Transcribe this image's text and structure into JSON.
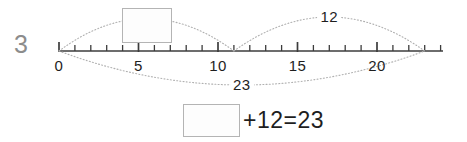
{
  "problem": {
    "number": "3",
    "type": "number-line-addition"
  },
  "number_line": {
    "min": 0,
    "max": 24,
    "tick_interval": 1,
    "labeled_ticks": [
      {
        "value": 0,
        "label": "0"
      },
      {
        "value": 5,
        "label": "5"
      },
      {
        "value": 10,
        "label": "10"
      },
      {
        "value": 15,
        "label": "15"
      },
      {
        "value": 20,
        "label": "20"
      }
    ],
    "axis_color": "#3c3c3c",
    "px_origin": 59,
    "px_per_unit": 15.9,
    "baseline_y": 51
  },
  "jumps": [
    {
      "id": "jump-unknown",
      "from": 0,
      "to": 11,
      "side": "above",
      "label": "",
      "has_answer_box": true,
      "style": "dotted"
    },
    {
      "id": "jump-twelve",
      "from": 11,
      "to": 23,
      "side": "above",
      "label": "12",
      "has_answer_box": false,
      "style": "dotted"
    },
    {
      "id": "jump-total",
      "from": 0,
      "to": 23,
      "side": "below",
      "label": "23",
      "has_answer_box": false,
      "style": "dotted"
    }
  ],
  "equation": {
    "blank_label": "",
    "expression": "+12=23",
    "addend_known": "12",
    "sum": "23"
  },
  "colors": {
    "arc": "#b0b0b0",
    "axis": "#3c3c3c",
    "box_border": "#b4b4b4",
    "text": "#1e1e1e",
    "q_number": "#8c8c8c",
    "background": "#ffffff"
  }
}
